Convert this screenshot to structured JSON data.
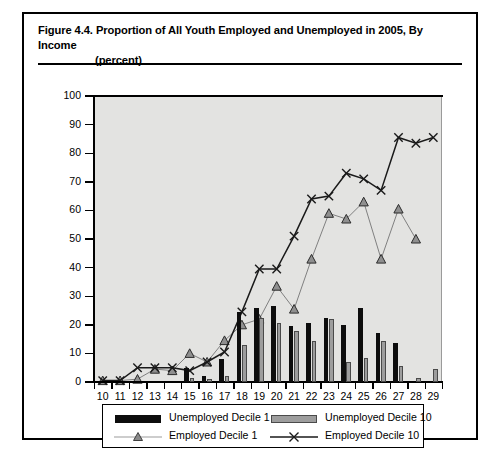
{
  "figure": {
    "label": "Figure 4.4.",
    "title_line1": "Proportion of All Youth Employed and Unemployed in 2005, By Income",
    "title_line2": "(percent)"
  },
  "colors": {
    "unemployed_d1": "#0d0d0d",
    "unemployed_d10": "#9d9d9d",
    "employed_d1": "#808080",
    "employed_d10": "#1a1a1a",
    "plot_background": "#e3e3e1",
    "frame": "#000000"
  },
  "legend": {
    "position": "below-axis",
    "items": [
      {
        "label": "Unemployed Decile 1",
        "marker": "filled-black-rect"
      },
      {
        "label": "Unemployed Decile 10",
        "marker": "filled-gray-rect"
      },
      {
        "label": "Employed Decile 1",
        "marker": "line-triangle"
      },
      {
        "label": "Employed Decile 10",
        "marker": "line-cross"
      }
    ]
  },
  "chart_data": {
    "type": "bar",
    "title": "Figure 4.4. Proportion of All Youth Employed and Unemployed in 2005, By Income (percent)",
    "xlabel": "",
    "ylabel": "",
    "grid": false,
    "ylim": [
      0,
      100
    ],
    "yticks": [
      0,
      10,
      20,
      30,
      40,
      50,
      60,
      70,
      80,
      90,
      100
    ],
    "categories": [
      10,
      11,
      12,
      13,
      14,
      15,
      16,
      17,
      18,
      19,
      20,
      21,
      22,
      23,
      24,
      25,
      26,
      27,
      28,
      29
    ],
    "xticklabels": [
      "10",
      "11",
      "12",
      "13",
      "14",
      "15",
      "16",
      "17",
      "18",
      "19",
      "20",
      "21",
      "22",
      "23",
      "24",
      "25",
      "26",
      "27",
      "28",
      "29"
    ],
    "series": [
      {
        "name": "Unemployed Decile 1",
        "kind": "bar",
        "color": "#0d0d0d",
        "values": [
          0,
          0,
          0,
          0,
          0,
          5,
          2,
          8,
          24.5,
          26,
          26.5,
          19.5,
          20.5,
          22.5,
          20,
          26,
          17,
          13.5,
          0,
          0
        ]
      },
      {
        "name": "Unemployed Decile 10",
        "kind": "bar",
        "color": "#9d9d9d",
        "values": [
          0,
          0,
          0,
          0,
          0,
          1.5,
          1,
          2,
          13,
          22.5,
          20.5,
          18,
          14.5,
          22,
          7,
          8.5,
          14.5,
          5.5,
          1.5,
          4.5
        ]
      },
      {
        "name": "Employed Decile 1",
        "kind": "line",
        "marker": "triangle",
        "color": "#808080",
        "values": [
          0.5,
          0.5,
          1,
          4.5,
          4,
          10,
          7,
          14.5,
          20,
          22,
          33.5,
          25.5,
          43,
          59,
          57,
          63,
          43,
          60.5,
          50,
          null
        ]
      },
      {
        "name": "Employed Decile 10",
        "kind": "line",
        "marker": "cross",
        "color": "#1a1a1a",
        "values": [
          0.5,
          0.5,
          5,
          5,
          5,
          4,
          7,
          10.5,
          24.5,
          39.5,
          39.5,
          51,
          64,
          65,
          73,
          71,
          67,
          85.5,
          83.5,
          85.5
        ]
      }
    ]
  }
}
